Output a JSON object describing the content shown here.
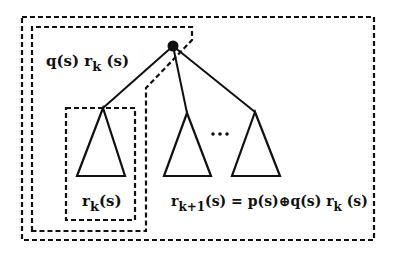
{
  "diagram": {
    "type": "tree-recurrence",
    "colors": {
      "stroke": "#111111",
      "background": "#ffffff"
    },
    "labels": {
      "outer_term": {
        "base": "q(s) r",
        "sub": "k",
        "tail": " (s)"
      },
      "subtree_term": {
        "base": "r",
        "sub": "k",
        "tail": "(s)"
      },
      "recurrence": {
        "base": "r",
        "sub": "k+1",
        "mid": "(s) = p(s)",
        "op": "⊕",
        "rest": "q(s) r",
        "sub2": "k",
        "tail": " (s)"
      },
      "ellipsis": "…"
    },
    "nodes": [
      {
        "id": "root",
        "x": 173,
        "y": 46,
        "filled": true
      }
    ],
    "subtrees": [
      {
        "id": "subtree-1",
        "apex": [
          103,
          108
        ],
        "base_left": [
          77,
          176
        ],
        "base_right": [
          125,
          176
        ]
      },
      {
        "id": "subtree-2",
        "apex": [
          187,
          113
        ],
        "base_left": [
          164,
          176
        ],
        "base_right": [
          211,
          176
        ]
      },
      {
        "id": "subtree-3",
        "apex": [
          255,
          112
        ],
        "base_left": [
          232,
          176
        ],
        "base_right": [
          280,
          176
        ]
      }
    ],
    "boxes": [
      {
        "id": "outer-box",
        "desc": "r_{k+1}(s) region"
      },
      {
        "id": "middle-box",
        "desc": "q(s) r_k(s) region"
      },
      {
        "id": "inner-box",
        "desc": "r_k(s) region"
      }
    ]
  }
}
